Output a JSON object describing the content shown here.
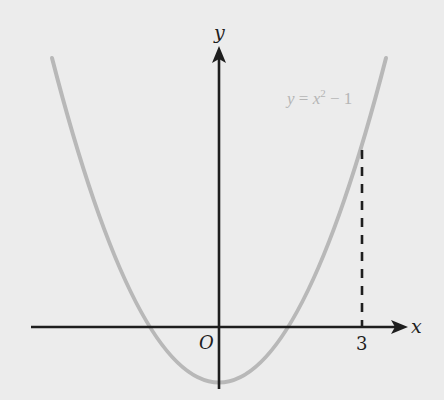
{
  "figure": {
    "type": "function-graph",
    "function_label": "y = x² − 1",
    "function_label_parts": {
      "lhs": "y",
      "eq": " = ",
      "base": "x",
      "exp": "2",
      "rest": " − 1"
    },
    "x_axis_label": "x",
    "y_axis_label": "y",
    "origin_label": "O",
    "marked_x_value": "3",
    "colors": {
      "background": "#ececec",
      "axes": "#1e1e1e",
      "curve": "#b8b8b8",
      "dashed_line": "#1e1e1e",
      "equation_text": "#b5b5b5"
    },
    "annotations": [
      {
        "kind": "dashed-vertical-line",
        "at_x": "3",
        "from": "x-axis",
        "to": "curve"
      }
    ]
  }
}
